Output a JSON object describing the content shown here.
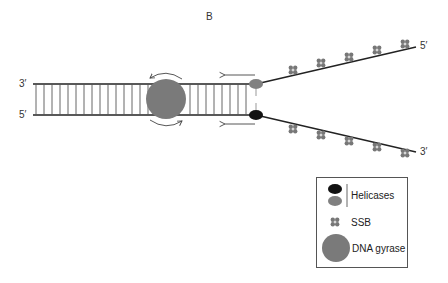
{
  "panel": {
    "label": "B"
  },
  "strands": {
    "left_top_end": "3′",
    "left_bottom_end": "5′",
    "right_top_end": "5′",
    "right_bottom_end": "3′"
  },
  "legend": {
    "items": [
      {
        "label": "Helicases",
        "icon": "helicase-ovals-icon"
      },
      {
        "label": "SSB",
        "icon": "ssb-tetramer-icon"
      },
      {
        "label": "DNA gyrase",
        "icon": "gyrase-circle-icon"
      }
    ]
  },
  "colors": {
    "strand": "#222222",
    "rung": "#555555",
    "gyrase": "#7a7a7a",
    "helicase_gray": "#808080",
    "helicase_black": "#111111",
    "ssb": "#777777"
  }
}
